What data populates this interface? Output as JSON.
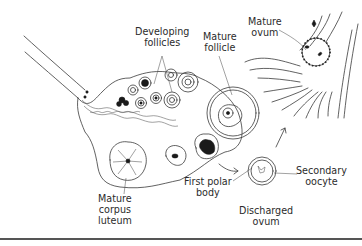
{
  "diagram": {
    "labels": {
      "developing_follicles": [
        "Developing",
        "follicles"
      ],
      "mature_follicle": [
        "Mature",
        "follicle"
      ],
      "mature_ovum": [
        "Mature",
        "ovum"
      ],
      "mature_corpus_luteum": [
        "Mature",
        "corpus",
        "luteum"
      ],
      "first_polar_body": [
        "First polar",
        "body"
      ],
      "secondary_oocyte": [
        "Secondary",
        "oocyte"
      ],
      "discharged_ovum": [
        "Discharged",
        "ovum"
      ]
    },
    "colors": {
      "ink": "#3a3a3a",
      "background": "#ffffff",
      "fill_dark": "#1a1a1a"
    }
  }
}
